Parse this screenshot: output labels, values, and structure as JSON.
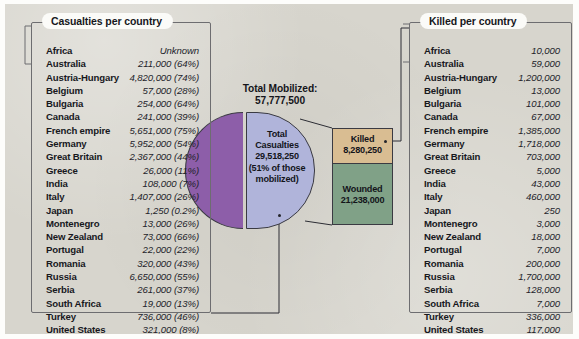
{
  "figure": {
    "mobilized_label": "Total Mobilized:",
    "mobilized_value": "57,777,500",
    "pie_label": "Total Casualties 29,518,250 (51% of those mobilized)",
    "killed_label": "Killed",
    "killed_value": "8,280,250",
    "wounded_label": "Wounded",
    "wounded_value": "21,238,000"
  },
  "colors": {
    "page_background": "#d7d5cd",
    "pie_non_casualty": "#8d5ea9",
    "pie_casualty": "#b0b4da",
    "killed": "#d9bd92",
    "wounded": "#80a187",
    "outline": "#3a3a42"
  },
  "left_panel": {
    "title": "Casualties per country",
    "rows": [
      {
        "country": "Africa",
        "value": "Unknown"
      },
      {
        "country": "Australia",
        "value": "211,000 (64%)"
      },
      {
        "country": "Austria-Hungary",
        "value": "4,820,000 (74%)"
      },
      {
        "country": "Belgium",
        "value": "57,000 (28%)"
      },
      {
        "country": "Bulgaria",
        "value": "254,000 (64%)"
      },
      {
        "country": "Canada",
        "value": "241,000 (39%)"
      },
      {
        "country": "French empire",
        "value": "5,651,000 (75%)"
      },
      {
        "country": "Germany",
        "value": "5,952,000 (54%)"
      },
      {
        "country": "Great Britain",
        "value": "2,367,000 (44%)"
      },
      {
        "country": "Greece",
        "value": "26,000 (11%)"
      },
      {
        "country": "India",
        "value": "108,000 (7%)"
      },
      {
        "country": "Italy",
        "value": "1,407,000 (26%)"
      },
      {
        "country": "Japan",
        "value": "1,250 (0.2%)"
      },
      {
        "country": "Montenegro",
        "value": "13,000 (26%)"
      },
      {
        "country": "New Zealand",
        "value": "73,000 (66%)"
      },
      {
        "country": "Portugal",
        "value": "22,000 (22%)"
      },
      {
        "country": "Romania",
        "value": "320,000 (43%)"
      },
      {
        "country": "Russia",
        "value": "6,650,000 (55%)"
      },
      {
        "country": "Serbia",
        "value": "261,000 (37%)"
      },
      {
        "country": "South Africa",
        "value": "19,000 (13%)"
      },
      {
        "country": "Turkey",
        "value": "736,000 (46%)"
      },
      {
        "country": "United States",
        "value": "321,000 (8%)"
      }
    ]
  },
  "right_panel": {
    "title": "Killed per country",
    "rows": [
      {
        "country": "Africa",
        "value": "10,000"
      },
      {
        "country": "Australia",
        "value": "59,000"
      },
      {
        "country": "Austria-Hungary",
        "value": "1,200,000"
      },
      {
        "country": "Belgium",
        "value": "13,000"
      },
      {
        "country": "Bulgaria",
        "value": "101,000"
      },
      {
        "country": "Canada",
        "value": "67,000"
      },
      {
        "country": "French empire",
        "value": "1,385,000"
      },
      {
        "country": "Germany",
        "value": "1,718,000"
      },
      {
        "country": "Great Britain",
        "value": "703,000"
      },
      {
        "country": "Greece",
        "value": "5,000"
      },
      {
        "country": "India",
        "value": "43,000"
      },
      {
        "country": "Italy",
        "value": "460,000"
      },
      {
        "country": "Japan",
        "value": "250"
      },
      {
        "country": "Montenegro",
        "value": "3,000"
      },
      {
        "country": "New Zealand",
        "value": "18,000"
      },
      {
        "country": "Portugal",
        "value": "7,000"
      },
      {
        "country": "Romania",
        "value": "200,000"
      },
      {
        "country": "Russia",
        "value": "1,700,000"
      },
      {
        "country": "Serbia",
        "value": "128,000"
      },
      {
        "country": "South Africa",
        "value": "7,000"
      },
      {
        "country": "Turkey",
        "value": "336,000"
      },
      {
        "country": "United States",
        "value": "117,000"
      }
    ]
  },
  "chart_data": {
    "type": "pie",
    "title": "Total Mobilized: 57,777,500",
    "total_mobilized": 57777500,
    "categories": [
      "Total Casualties",
      "Not a casualty"
    ],
    "values": [
      29518250,
      28259250
    ],
    "percentages": [
      51,
      49
    ],
    "breakout": {
      "type": "bar",
      "of_category": "Total Casualties",
      "categories": [
        "Killed",
        "Wounded"
      ],
      "values": [
        8280250,
        21238000
      ]
    },
    "legend": "none",
    "grid": false
  }
}
